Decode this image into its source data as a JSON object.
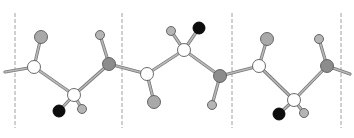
{
  "diagram": {
    "type": "ball-and-stick polymer chain",
    "width": 354,
    "height": 138,
    "colors": {
      "background": "#ffffff",
      "bond_fill": "#b8b8b8",
      "bond_stroke": "#7a7a7a",
      "atom_stroke": "#5a5a5a",
      "dashed_line": "#a0a0a0",
      "white_atom": "#ffffff",
      "gray_atom": "#a9a9a9",
      "dark_gray_atom": "#8c8c8c",
      "light_gray_atom": "#b5b5b5",
      "black_atom": "#0d0d0d"
    },
    "repeat_unit_dividers": [
      {
        "x": 15,
        "y1": 13,
        "y2": 128
      },
      {
        "x": 122,
        "y1": 13,
        "y2": 128
      },
      {
        "x": 232,
        "y1": 13,
        "y2": 128
      },
      {
        "x": 341,
        "y1": 13,
        "y2": 128
      }
    ],
    "atoms": [
      {
        "id": "a1",
        "kind": "white",
        "x": 34,
        "y": 67,
        "r": 6.5
      },
      {
        "id": "a2",
        "kind": "gray",
        "x": 41,
        "y": 37,
        "r": 6.5
      },
      {
        "id": "a3",
        "kind": "white",
        "x": 74,
        "y": 95,
        "r": 6.5
      },
      {
        "id": "a4",
        "kind": "black",
        "x": 59,
        "y": 111,
        "r": 6
      },
      {
        "id": "a5",
        "kind": "light_gray",
        "x": 82,
        "y": 109,
        "r": 4.5
      },
      {
        "id": "a6",
        "kind": "dark_gray",
        "x": 109,
        "y": 64,
        "r": 6.5
      },
      {
        "id": "a7",
        "kind": "light_gray",
        "x": 100,
        "y": 35,
        "r": 4.5
      },
      {
        "id": "a8",
        "kind": "white",
        "x": 147,
        "y": 74,
        "r": 6.5
      },
      {
        "id": "a9",
        "kind": "gray",
        "x": 154,
        "y": 102,
        "r": 6.5
      },
      {
        "id": "a10",
        "kind": "white",
        "x": 184,
        "y": 50,
        "r": 6.5
      },
      {
        "id": "a11",
        "kind": "light_gray",
        "x": 171,
        "y": 31,
        "r": 4.5
      },
      {
        "id": "a12",
        "kind": "black",
        "x": 199,
        "y": 28,
        "r": 6
      },
      {
        "id": "a13",
        "kind": "dark_gray",
        "x": 220,
        "y": 76,
        "r": 6.5
      },
      {
        "id": "a14",
        "kind": "light_gray",
        "x": 212,
        "y": 105,
        "r": 4.5
      },
      {
        "id": "a15",
        "kind": "white",
        "x": 259,
        "y": 66,
        "r": 6.5
      },
      {
        "id": "a16",
        "kind": "gray",
        "x": 267,
        "y": 39,
        "r": 6.5
      },
      {
        "id": "a17",
        "kind": "white",
        "x": 294,
        "y": 100,
        "r": 6.5
      },
      {
        "id": "a18",
        "kind": "black",
        "x": 279,
        "y": 114,
        "r": 6
      },
      {
        "id": "a19",
        "kind": "light_gray",
        "x": 304,
        "y": 113,
        "r": 4.5
      },
      {
        "id": "a20",
        "kind": "dark_gray",
        "x": 327,
        "y": 66,
        "r": 6.5
      },
      {
        "id": "a21",
        "kind": "light_gray",
        "x": 319,
        "y": 39,
        "r": 4.5
      }
    ],
    "bonds": [
      {
        "x1": 5,
        "y1": 72,
        "x2": 34,
        "y2": 67
      },
      {
        "x1": 34,
        "y1": 67,
        "x2": 41,
        "y2": 37
      },
      {
        "x1": 34,
        "y1": 67,
        "x2": 74,
        "y2": 95
      },
      {
        "x1": 74,
        "y1": 95,
        "x2": 59,
        "y2": 111
      },
      {
        "x1": 74,
        "y1": 95,
        "x2": 82,
        "y2": 109
      },
      {
        "x1": 74,
        "y1": 95,
        "x2": 109,
        "y2": 64
      },
      {
        "x1": 109,
        "y1": 64,
        "x2": 100,
        "y2": 35
      },
      {
        "x1": 109,
        "y1": 64,
        "x2": 147,
        "y2": 74
      },
      {
        "x1": 147,
        "y1": 74,
        "x2": 154,
        "y2": 102
      },
      {
        "x1": 147,
        "y1": 74,
        "x2": 184,
        "y2": 50
      },
      {
        "x1": 184,
        "y1": 50,
        "x2": 171,
        "y2": 31
      },
      {
        "x1": 184,
        "y1": 50,
        "x2": 199,
        "y2": 28
      },
      {
        "x1": 184,
        "y1": 50,
        "x2": 220,
        "y2": 76
      },
      {
        "x1": 220,
        "y1": 76,
        "x2": 212,
        "y2": 105
      },
      {
        "x1": 220,
        "y1": 76,
        "x2": 259,
        "y2": 66
      },
      {
        "x1": 259,
        "y1": 66,
        "x2": 267,
        "y2": 39
      },
      {
        "x1": 259,
        "y1": 66,
        "x2": 294,
        "y2": 100
      },
      {
        "x1": 294,
        "y1": 100,
        "x2": 279,
        "y2": 114
      },
      {
        "x1": 294,
        "y1": 100,
        "x2": 304,
        "y2": 113
      },
      {
        "x1": 294,
        "y1": 100,
        "x2": 327,
        "y2": 66
      },
      {
        "x1": 327,
        "y1": 66,
        "x2": 319,
        "y2": 39
      },
      {
        "x1": 327,
        "y1": 66,
        "x2": 350,
        "y2": 74
      }
    ]
  }
}
